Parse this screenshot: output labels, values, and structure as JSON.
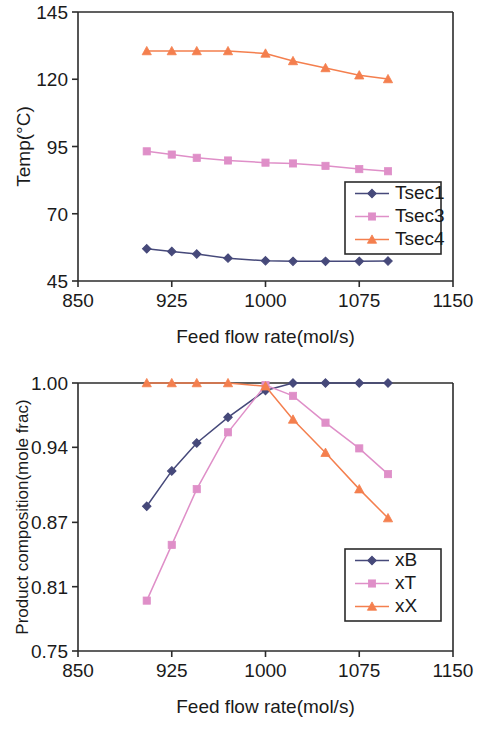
{
  "figure": {
    "background": "#ffffff",
    "panels": [
      "temperature-profile",
      "product-composition"
    ]
  },
  "colors": {
    "series_navy": "#46497a",
    "series_pink": "#dd8bc0",
    "series_orange": "#f08050",
    "axis": "#2b2b2b",
    "text": "#1a1a1a",
    "marker_navy_fill": "#46497a",
    "marker_pink_fill": "#df8fc8",
    "marker_orange_fill": "#f47f4e"
  },
  "top_chart": {
    "ylabel": "Temp(°C)",
    "xlabel": "Feed flow rate(mol/s)",
    "ytick_labels": [
      "45",
      "70",
      "95",
      "120",
      "145"
    ],
    "xtick_labels": [
      "850",
      "925",
      "1000",
      "1075",
      "1150"
    ],
    "legend": [
      {
        "label": "Tsec1",
        "marker": "diamond",
        "color": "#46497a"
      },
      {
        "label": "Tsec3",
        "marker": "square",
        "color": "#df8fc8"
      },
      {
        "label": "Tsec4",
        "marker": "triangle",
        "color": "#f47f4e"
      }
    ]
  },
  "bottom_chart": {
    "ylabel": "Product composition(mole frac)",
    "xlabel": "Feed flow rate(mol/s)",
    "ytick_labels": [
      "0.75",
      "0.81",
      "0.87",
      "0.94",
      "1.00"
    ],
    "xtick_labels": [
      "850",
      "925",
      "1000",
      "1075",
      "1150"
    ],
    "legend": [
      {
        "label": "xB",
        "marker": "diamond",
        "color": "#46497a"
      },
      {
        "label": "xT",
        "marker": "square",
        "color": "#df8fc8"
      },
      {
        "label": "xX",
        "marker": "triangle",
        "color": "#f47f4e"
      }
    ]
  },
  "chart_data": [
    {
      "id": "temperature-profile",
      "type": "line",
      "title": "",
      "xlabel": "Feed flow rate(mol/s)",
      "ylabel": "Temp(°C)",
      "xlim": [
        850,
        1150
      ],
      "ylim": [
        45,
        145
      ],
      "xticks": [
        850,
        925,
        1000,
        1075,
        1150
      ],
      "yticks": [
        45,
        70,
        95,
        120,
        145
      ],
      "grid": false,
      "legend_position": "lower-right-inside",
      "x": [
        905,
        925,
        945,
        970,
        1000,
        1022,
        1048,
        1075,
        1098
      ],
      "series": [
        {
          "name": "Tsec1",
          "marker": "diamond",
          "color": "#46497a",
          "values": [
            57.0,
            56.0,
            55.0,
            53.5,
            52.5,
            52.3,
            52.3,
            52.3,
            52.4
          ]
        },
        {
          "name": "Tsec3",
          "marker": "square",
          "color": "#df8fc8",
          "values": [
            93.2,
            92.0,
            90.8,
            89.8,
            89.0,
            88.7,
            87.8,
            86.6,
            85.8
          ]
        },
        {
          "name": "Tsec4",
          "marker": "triangle",
          "color": "#f47f4e",
          "values": [
            130.5,
            130.5,
            130.5,
            130.5,
            129.6,
            126.8,
            124.2,
            121.5,
            120.1
          ]
        }
      ]
    },
    {
      "id": "product-composition",
      "type": "line",
      "title": "",
      "xlabel": "Feed flow rate(mol/s)",
      "ylabel": "Product composition(mole frac)",
      "xlim": [
        850,
        1150
      ],
      "ylim": [
        0.75,
        1.0
      ],
      "xticks": [
        850,
        925,
        1000,
        1075,
        1150
      ],
      "yticks": [
        0.75,
        0.81,
        0.87,
        0.94,
        1.0
      ],
      "grid": false,
      "legend_position": "lower-right-inside",
      "x": [
        905,
        925,
        945,
        970,
        1000,
        1022,
        1048,
        1075,
        1098
      ],
      "series": [
        {
          "name": "xB",
          "marker": "diamond",
          "color": "#46497a",
          "values": [
            0.885,
            0.918,
            0.944,
            0.968,
            0.993,
            1.0,
            1.0,
            1.0,
            1.0
          ]
        },
        {
          "name": "xT",
          "marker": "square",
          "color": "#df8fc8",
          "values": [
            0.797,
            0.849,
            0.901,
            0.954,
            0.998,
            0.988,
            0.963,
            0.939,
            0.915
          ]
        },
        {
          "name": "xX",
          "marker": "triangle",
          "color": "#f47f4e",
          "values": [
            1.0,
            1.0,
            1.0,
            1.0,
            0.997,
            0.966,
            0.935,
            0.901,
            0.874
          ]
        }
      ]
    }
  ]
}
